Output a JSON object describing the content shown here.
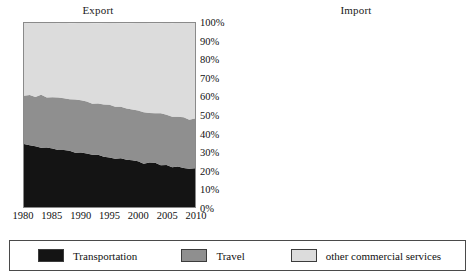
{
  "chart_data": {
    "type": "area",
    "stacked": true,
    "normalized": true,
    "charts": [
      {
        "title": "Export",
        "x": [
          1980,
          1981,
          1982,
          1983,
          1984,
          1985,
          1986,
          1987,
          1988,
          1989,
          1990,
          1991,
          1992,
          1993,
          1994,
          1995,
          1996,
          1997,
          1998,
          1999,
          2000,
          2001,
          2002,
          2003,
          2004,
          2005,
          2006,
          2007,
          2008,
          2009,
          2010
        ],
        "xlabel": "",
        "ylabel": "",
        "ylim": [
          0,
          100
        ],
        "xlim": [
          1980,
          2010
        ],
        "xticks": [
          "1980",
          "1985",
          "1990",
          "1995",
          "2000",
          "2005",
          "2010"
        ],
        "yticks": [
          "0%",
          "10%",
          "20%",
          "30%",
          "40%",
          "50%",
          "60%",
          "70%",
          "80%",
          "90%",
          "100%"
        ],
        "grid": false,
        "series": [
          {
            "name": "Transportation",
            "color": "#141414",
            "values": [
              34,
              33.5,
              33,
              32.5,
              32,
              31.5,
              31,
              31,
              30.5,
              30,
              29.5,
              29,
              28.5,
              28,
              27.5,
              27,
              26.5,
              26,
              25.5,
              25,
              24.5,
              24,
              24,
              23.5,
              23,
              22.5,
              22,
              21.5,
              21.5,
              21,
              21
            ]
          },
          {
            "name": "Travel",
            "color": "#8f8f8f",
            "values": [
              27,
              27.5,
              27,
              28,
              27.5,
              28,
              28.5,
              28,
              28,
              28.5,
              28,
              28,
              28,
              28,
              28,
              28,
              28,
              28,
              28,
              28,
              28,
              28,
              27.5,
              27.5,
              27.5,
              27.5,
              27.5,
              27.5,
              27,
              27,
              27
            ]
          },
          {
            "name": "other commercial services",
            "color": "#dcdcdc",
            "values": [
              39,
              39,
              40,
              39.5,
              40.5,
              40.5,
              40.5,
              41,
              41.5,
              41.5,
              42.5,
              43,
              43.5,
              44,
              44.5,
              45,
              45.5,
              46,
              46.5,
              47,
              47.5,
              48,
              48.5,
              49,
              49.5,
              50,
              50.5,
              51,
              51.5,
              52,
              52
            ]
          }
        ],
        "series_top_boundaries_pct": {
          "transportation_top": [
            34,
            33.5,
            33,
            32.5,
            32,
            31.5,
            31,
            31,
            30.5,
            30,
            29.5,
            29,
            28.5,
            28,
            27.5,
            27,
            26.5,
            26,
            25.5,
            25,
            24.5,
            24,
            24,
            23.5,
            23,
            22.5,
            22,
            21.5,
            21.5,
            21,
            21
          ],
          "travel_top": [
            61,
            61,
            60,
            60.5,
            59.5,
            59.5,
            59.5,
            59,
            58.5,
            58.5,
            57.5,
            57,
            56.5,
            56,
            55.5,
            55,
            54.5,
            54,
            53.5,
            53,
            52.5,
            52,
            51.5,
            51,
            50.5,
            50,
            49.5,
            49,
            48.5,
            48,
            48
          ]
        }
      },
      {
        "title": "Import",
        "x": [
          1980,
          1981,
          1982,
          1983,
          1984,
          1985,
          1986,
          1987,
          1988,
          1989,
          1990,
          1991,
          1992,
          1993,
          1994,
          1995,
          1996,
          1997,
          1998,
          1999,
          2000,
          2001,
          2002,
          2003,
          2004,
          2005,
          2006,
          2007,
          2008,
          2009,
          2010
        ],
        "xlabel": "",
        "ylabel": "",
        "ylim": [
          0,
          100
        ],
        "xlim": [
          1980,
          2010
        ],
        "xticks": [
          "1980",
          "1985",
          "1990",
          "1995",
          "2000",
          "2005",
          "2010"
        ],
        "yticks": [
          "0%",
          "10%",
          "20%",
          "30%",
          "40%",
          "50%",
          "60%",
          "70%",
          "80%",
          "90%",
          "100%"
        ],
        "grid": false,
        "series": [
          {
            "name": "Transportation",
            "color": "#141414",
            "values": [
              41,
              40,
              39.5,
              38.5,
              38,
              37,
              36.5,
              35.5,
              35,
              34,
              33.5,
              33,
              32.5,
              32,
              31.5,
              31,
              31,
              30.5,
              30,
              29.5,
              29,
              28.5,
              28,
              27.5,
              27,
              26.5,
              26,
              25.5,
              25,
              24.5,
              24
            ]
          },
          {
            "name": "Travel",
            "color": "#8f8f8f",
            "values": [
              25,
              26,
              26,
              26.5,
              27,
              27.5,
              27.5,
              28,
              28,
              28.5,
              28.5,
              28.5,
              28.5,
              28.5,
              28.5,
              28.5,
              28,
              28,
              28,
              28,
              28,
              28,
              28,
              28,
              28,
              28,
              28,
              28,
              28,
              28,
              28
            ]
          },
          {
            "name": "other commercial services",
            "color": "#dcdcdc",
            "values": [
              34,
              34,
              34.5,
              35,
              35,
              35.5,
              36,
              36.5,
              37,
              37.5,
              38,
              38.5,
              39,
              39.5,
              40,
              40.5,
              41,
              41.5,
              42,
              42.5,
              43,
              43.5,
              44,
              44.5,
              45,
              45.5,
              46,
              46.5,
              47,
              47.5,
              48
            ]
          }
        ],
        "series_top_boundaries_pct": {
          "transportation_top": [
            41,
            40,
            39.5,
            38.5,
            38,
            37,
            36.5,
            35.5,
            35,
            34,
            33.5,
            33,
            32.5,
            32,
            31.5,
            31,
            31,
            30.5,
            30,
            29.5,
            29,
            28.5,
            28,
            27.5,
            27,
            26.5,
            26,
            25.5,
            25,
            24.5,
            24
          ],
          "travel_top": [
            66,
            66,
            65.5,
            65,
            65,
            64.5,
            64,
            63.5,
            63,
            62.5,
            62,
            61.5,
            61,
            60.5,
            60,
            59.5,
            59,
            58.5,
            58,
            57.5,
            57,
            56.5,
            56,
            55.5,
            55,
            54.5,
            54,
            53.5,
            53,
            52.5,
            52
          ]
        }
      }
    ],
    "legend": {
      "position": "bottom",
      "entries": [
        {
          "label": "Transportation",
          "color": "#141414"
        },
        {
          "label": "Travel",
          "color": "#8f8f8f"
        },
        {
          "label": "other commercial services",
          "color": "#dcdcdc"
        }
      ]
    }
  }
}
